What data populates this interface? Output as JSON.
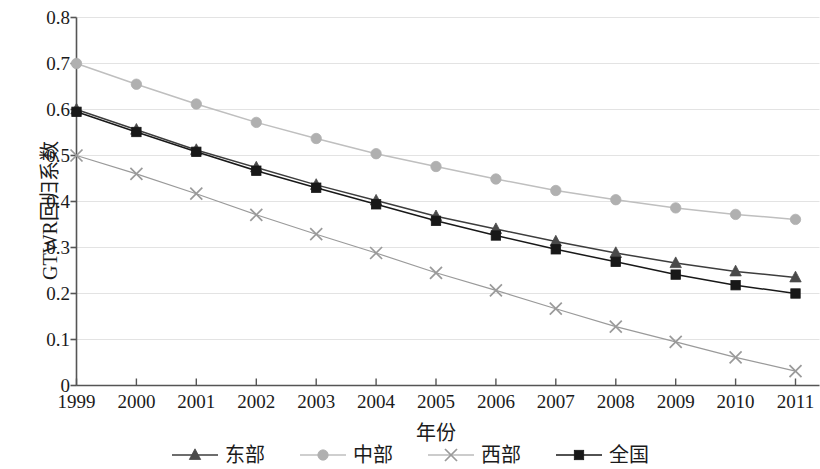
{
  "chart_data": {
    "type": "line",
    "title": "",
    "xlabel": "年份",
    "ylabel": "GTWR回归系数",
    "x": [
      1999,
      2000,
      2001,
      2002,
      2003,
      2004,
      2005,
      2006,
      2007,
      2008,
      2009,
      2010,
      2011
    ],
    "categories": [
      "1999",
      "2000",
      "2001",
      "2002",
      "2003",
      "2004",
      "2005",
      "2006",
      "2007",
      "2008",
      "2009",
      "2010",
      "2011"
    ],
    "xlim": [
      1999,
      2011
    ],
    "ylim": [
      0,
      0.8
    ],
    "yticks": [
      0,
      0.1,
      0.2,
      0.3,
      0.4,
      0.5,
      0.6,
      0.7,
      0.8
    ],
    "ytick_labels": [
      "0",
      "0.1",
      "0.2",
      "0.3",
      "0.4",
      "0.5",
      "0.6",
      "0.7",
      "0.8"
    ],
    "grid": "horizontal",
    "legend_position": "bottom",
    "series": [
      {
        "name": "东部",
        "marker": "triangle",
        "color": "#4a4a4a",
        "line_color": "#3d3d3d",
        "values": [
          0.6,
          0.556,
          0.512,
          0.474,
          0.436,
          0.402,
          0.368,
          0.34,
          0.313,
          0.288,
          0.266,
          0.248,
          0.235
        ]
      },
      {
        "name": "中部",
        "marker": "circle",
        "color": "#b0b0b0",
        "line_color": "#bfbfbf",
        "values": [
          0.7,
          0.655,
          0.612,
          0.572,
          0.537,
          0.504,
          0.476,
          0.449,
          0.424,
          0.404,
          0.386,
          0.372,
          0.361
        ]
      },
      {
        "name": "西部",
        "marker": "cross",
        "color": "#9a9a9a",
        "line_color": "#9a9a9a",
        "values": [
          0.5,
          0.46,
          0.417,
          0.371,
          0.329,
          0.288,
          0.245,
          0.207,
          0.167,
          0.128,
          0.095,
          0.061,
          0.031
        ]
      },
      {
        "name": "全国",
        "marker": "square",
        "color": "#181818",
        "line_color": "#181818",
        "values": [
          0.595,
          0.551,
          0.508,
          0.467,
          0.43,
          0.394,
          0.358,
          0.326,
          0.296,
          0.269,
          0.241,
          0.218,
          0.2
        ]
      }
    ]
  },
  "axes": {
    "axis_color": "#555555",
    "grid_color": "#e3e3e3"
  }
}
